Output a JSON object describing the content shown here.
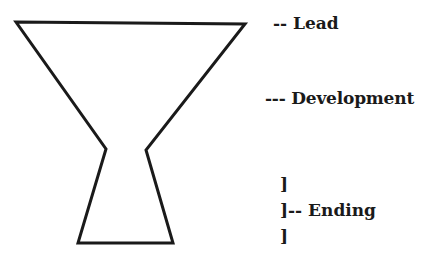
{
  "diagram": {
    "type": "inverted-pyramid-story-structure",
    "shape": {
      "stroke": "#1a1a1a",
      "stroke_width": 3,
      "points": [
        [
          16,
          22
        ],
        [
          245,
          24
        ],
        [
          146,
          150
        ],
        [
          173,
          243
        ],
        [
          78,
          243
        ],
        [
          106,
          149
        ]
      ]
    },
    "labels": {
      "lead": "-- Lead",
      "development": "--- Development",
      "ending_bracket_top": "]",
      "ending": "]-- Ending",
      "ending_bracket_bottom": "]"
    }
  }
}
